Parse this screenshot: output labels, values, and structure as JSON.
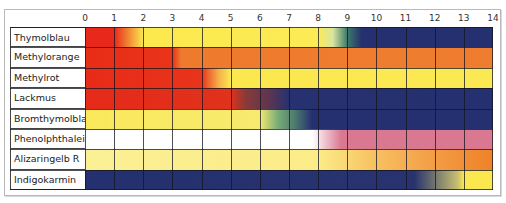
{
  "chart_data": {
    "type": "heatmap",
    "title": "",
    "xlabel": "pH",
    "ylabel": "",
    "x_ticks": [
      0,
      1,
      2,
      3,
      4,
      5,
      6,
      7,
      8,
      9,
      10,
      11,
      12,
      13,
      14
    ],
    "xlim": [
      0,
      14
    ],
    "grid": true,
    "legend": null,
    "rows": [
      {
        "name": "Thymolblau",
        "stops": [
          {
            "ph": 0,
            "color": "#e8281a"
          },
          {
            "ph": 1,
            "color": "#e8281a"
          },
          {
            "ph": 2,
            "color": "#fbe94e"
          },
          {
            "ph": 8,
            "color": "#fbeb55"
          },
          {
            "ph": 8.5,
            "color": "#d9e6a0"
          },
          {
            "ph": 9,
            "color": "#3d7a6a"
          },
          {
            "ph": 9.5,
            "color": "#24306f"
          },
          {
            "ph": 14,
            "color": "#24306f"
          }
        ]
      },
      {
        "name": "Methylorange",
        "stops": [
          {
            "ph": 0,
            "color": "#e82d16"
          },
          {
            "ph": 3,
            "color": "#e8341a"
          },
          {
            "ph": 3.3,
            "color": "#ee7a2e"
          },
          {
            "ph": 14,
            "color": "#ef7d2f"
          }
        ]
      },
      {
        "name": "Methylrot",
        "stops": [
          {
            "ph": 0,
            "color": "#e82b18"
          },
          {
            "ph": 4,
            "color": "#e8341a"
          },
          {
            "ph": 4.6,
            "color": "#f6b24a"
          },
          {
            "ph": 5,
            "color": "#fbe84f"
          },
          {
            "ph": 14,
            "color": "#fbe954"
          }
        ]
      },
      {
        "name": "Lackmus",
        "stops": [
          {
            "ph": 0,
            "color": "#e52a18"
          },
          {
            "ph": 5,
            "color": "#e0321c"
          },
          {
            "ph": 5.5,
            "color": "#8a3a38"
          },
          {
            "ph": 6.3,
            "color": "#5e3550"
          },
          {
            "ph": 7,
            "color": "#27316f"
          },
          {
            "ph": 14,
            "color": "#24306f"
          }
        ]
      },
      {
        "name": "Bromthymolblau",
        "stops": [
          {
            "ph": 0,
            "color": "#fbe85a"
          },
          {
            "ph": 6,
            "color": "#f6ea70"
          },
          {
            "ph": 6.6,
            "color": "#7aae78"
          },
          {
            "ph": 7.2,
            "color": "#4e7a70"
          },
          {
            "ph": 7.8,
            "color": "#24306f"
          },
          {
            "ph": 14,
            "color": "#24306f"
          }
        ]
      },
      {
        "name": "Phenolphthalein",
        "stops": [
          {
            "ph": 0,
            "color": "#ffffff"
          },
          {
            "ph": 7.8,
            "color": "#ffffff"
          },
          {
            "ph": 8.8,
            "color": "#d97890"
          },
          {
            "ph": 14,
            "color": "#d97890"
          }
        ]
      },
      {
        "name": "Alizaringelb R",
        "stops": [
          {
            "ph": 0,
            "color": "#fbf095"
          },
          {
            "ph": 8,
            "color": "#fbec88"
          },
          {
            "ph": 10,
            "color": "#f7c060"
          },
          {
            "ph": 12,
            "color": "#f39c45"
          },
          {
            "ph": 14,
            "color": "#ef8228"
          }
        ]
      },
      {
        "name": "Indigokarmin",
        "stops": [
          {
            "ph": 0,
            "color": "#24306f"
          },
          {
            "ph": 11.3,
            "color": "#28336e"
          },
          {
            "ph": 12.8,
            "color": "#c8c070"
          },
          {
            "ph": 13,
            "color": "#fbe84f"
          },
          {
            "ph": 14,
            "color": "#fbe84f"
          }
        ]
      }
    ]
  },
  "labels": {
    "rows": [
      "Thymolblau",
      "Methylorange",
      "Methylrot",
      "Lackmus",
      "Bromthymolblau",
      "Phenolphthalein",
      "Alizaringelb R",
      "Indigokarmin"
    ],
    "ticks": [
      "0",
      "1",
      "2",
      "3",
      "4",
      "5",
      "6",
      "7",
      "8",
      "9",
      "10",
      "11",
      "12",
      "13",
      "14"
    ]
  }
}
